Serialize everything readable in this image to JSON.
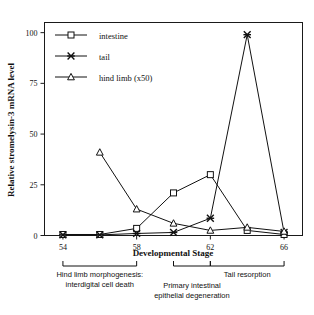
{
  "chart_data": {
    "type": "line",
    "title": "",
    "xlabel": "Developmental Stage",
    "ylabel": "Relative stromelysin-3 mRNA level",
    "xlim": [
      53,
      67
    ],
    "ylim": [
      0,
      105
    ],
    "xticks": [
      54,
      58,
      62,
      66
    ],
    "yticks": [
      0,
      25,
      50,
      75,
      100
    ],
    "grid": false,
    "legend_position": "top-left",
    "series": [
      {
        "name": "intestine",
        "marker": "square",
        "x": [
          54,
          56,
          58,
          60,
          62,
          64,
          66
        ],
        "values": [
          0.5,
          0.5,
          3.5,
          21,
          30,
          2.5,
          0.5
        ]
      },
      {
        "name": "tail",
        "marker": "x",
        "x": [
          54,
          56,
          58,
          60,
          62,
          64,
          66
        ],
        "values": [
          0.3,
          0.3,
          1,
          1.5,
          8.5,
          99,
          1.5
        ]
      },
      {
        "name": "hind limb (x50)",
        "marker": "triangle",
        "x": [
          56,
          58,
          60,
          62,
          64,
          66
        ],
        "values": [
          41,
          13,
          6,
          2.5,
          4,
          2
        ]
      }
    ],
    "annotations": [
      {
        "id": "hind-limb-bracket",
        "lines": [
          "Hind limb morphogenesis:",
          "interdigital cell death"
        ],
        "x_start": 54,
        "x_end": 58
      },
      {
        "id": "intestine-bracket",
        "lines": [
          "Primary intestinal",
          "epithelial degeneration"
        ],
        "x_start": 60,
        "x_end": 62
      },
      {
        "id": "tail-bracket",
        "lines": [
          "Tail resorption"
        ],
        "x_start": 62,
        "x_end": 66
      }
    ]
  }
}
